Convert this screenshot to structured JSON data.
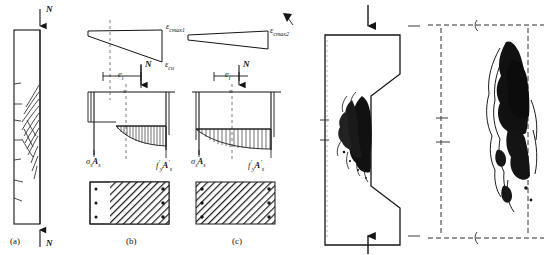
{
  "figure": {
    "background_color": "#ffffff",
    "ink_color": "#151515",
    "panels": [
      {
        "id": "a",
        "caption": "(a)",
        "type": "column-crack-elevation",
        "description": "Tall slender reinforced concrete column elevation with flexural crack pattern concentrated near mid-height",
        "load_label_top": "N",
        "load_label_bottom": "N"
      },
      {
        "id": "b",
        "caption": "(b)",
        "type": "strain-stress-section",
        "strain_label_right": "ε",
        "strain_label_right_sub": "cmax1",
        "strain_label_bottom": "ε",
        "strain_label_bottom_sub": "cu",
        "eccentricity_label": "e",
        "eccentricity_sub": "i",
        "axial_load_label": "N",
        "neutral_axis_label": "x",
        "stress_label_left": "σ",
        "stress_label_left_sub": "s",
        "stress_label_left_tail": "A",
        "stress_label_left_tail_sub": "s",
        "stress_label_right": "f",
        "stress_label_right_prime": "′",
        "stress_label_right_sub": "y",
        "stress_label_right_tail": "A",
        "stress_label_right_tail_prime": "′",
        "stress_label_right_tail_sub": "s",
        "compression_zone_fraction": 0.74
      },
      {
        "id": "c",
        "caption": "(c)",
        "type": "strain-stress-section",
        "strain_label_right": "ε",
        "strain_label_right_sub": "cmax2",
        "eccentricity_label": "e",
        "eccentricity_sub": "i",
        "axial_load_label": "N",
        "neutral_axis_label": "x",
        "stress_label_left": "σ",
        "stress_label_left_sub": "s",
        "stress_label_left_tail": "A",
        "stress_label_left_tail_sub": "s",
        "stress_label_right": "f",
        "stress_label_right_prime": "′",
        "stress_label_right_sub": "y",
        "stress_label_right_tail": "A",
        "stress_label_right_tail_prime": "′",
        "stress_label_right_tail_sub": "s",
        "compression_zone_fraction": 1.0
      },
      {
        "id": "photo-1",
        "type": "failure-photograph",
        "description": "Stepped Z-shaped column specimen photograph showing concrete crushing and spalling at the mid-height offset region",
        "load_label_top": "",
        "load_label_bottom": ""
      },
      {
        "id": "photo-2",
        "type": "failure-photograph",
        "description": "Rectangular column specimen photograph showing concrete crushing and cracking along the right-hand compression face"
      }
    ]
  }
}
